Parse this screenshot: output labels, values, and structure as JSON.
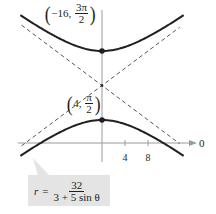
{
  "chart_data": {
    "type": "line",
    "title": "",
    "equation": {
      "lhs": "r",
      "equals": "=",
      "numerator": "32",
      "denominator": "3 + 5 sin θ"
    },
    "curve": "hyperbola",
    "polar_axis_label": "0",
    "x_ticks": [
      4,
      8
    ],
    "x_tick_labels": [
      "4",
      "8"
    ],
    "vertices": [
      {
        "label_r": "−16",
        "label_theta_num": "3π",
        "label_theta_den": "2",
        "r": -16,
        "theta": "3π/2",
        "x": 0,
        "y": 16
      },
      {
        "label_r": "4",
        "label_theta_num": "π",
        "label_theta_den": "2",
        "r": 4,
        "theta": "π/2",
        "x": 0,
        "y": 4
      }
    ],
    "center": {
      "x": 0,
      "y": 10
    },
    "asymptotes": [
      {
        "slope": 0.75,
        "through": [
          0,
          10
        ],
        "style": "dashed"
      },
      {
        "slope": -0.75,
        "through": [
          0,
          10
        ],
        "style": "dashed"
      }
    ],
    "xlim": [
      -14.5,
      14.5
    ],
    "ylim": [
      -3,
      23
    ],
    "grid": false,
    "colors": {
      "curve": "#231f20",
      "asymptote": "#555555",
      "axis": "#9a9a9a",
      "callout": "#e4e4e4"
    }
  }
}
